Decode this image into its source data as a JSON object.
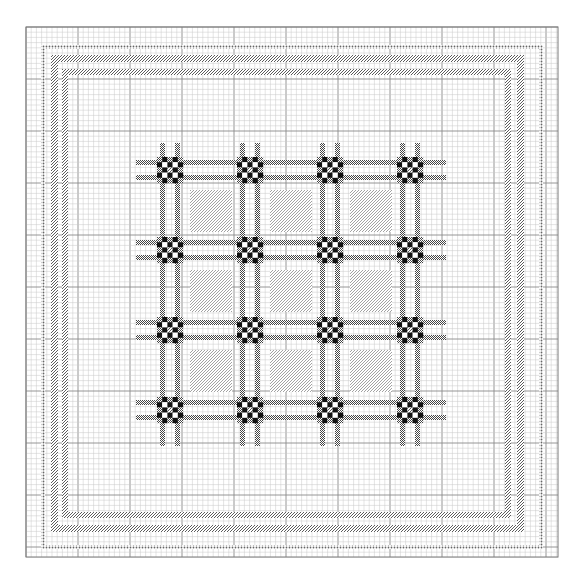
{
  "canvas": {
    "width": 588,
    "height": 588,
    "background": "#ffffff"
  },
  "grid": {
    "left": 26,
    "top": 27,
    "right": 558,
    "bottom": 557,
    "cell": 5.2,
    "fine_line_color": "#c8c8c8",
    "major_line_color": "#8a8a8a",
    "major_every": 10,
    "frame_color": "#7a7a7a"
  },
  "colors": {
    "solid": "#111111",
    "hatch": "#555555",
    "dot": "#666666",
    "white": "#ffffff"
  },
  "borders": [
    {
      "name": "outer-dotted-border",
      "style": "dotted",
      "inset_outer": 41,
      "inset_inner_right": 542,
      "thickness": 4
    },
    {
      "name": "middle-diagonal-border",
      "style": "diagonal",
      "outer": 51,
      "outer_far": 523,
      "thickness": 6
    },
    {
      "name": "inner-diagonal-border",
      "style": "diagonal",
      "outer": 62,
      "outer_far": 510,
      "thickness": 6
    }
  ],
  "lattice": {
    "extent": {
      "left": 136,
      "top": 143,
      "right": 446,
      "bottom": 446
    },
    "crossing_centers": [
      170,
      250,
      330,
      410
    ],
    "stripe_offset": 7.5,
    "stripe_width": 5,
    "crossing_cell": 5.2,
    "crossing_pattern": [
      [
        "s",
        "B",
        "s",
        "B",
        "s"
      ],
      [
        "B",
        "W",
        "B",
        "W",
        "B"
      ],
      [
        "s",
        "B",
        "H",
        "B",
        "s"
      ],
      [
        "B",
        "W",
        "B",
        "W",
        "B"
      ],
      [
        "s",
        "B",
        "s",
        "B",
        "s"
      ]
    ],
    "panels": {
      "count_per_side": 3,
      "inset": 20,
      "style": "diagonal"
    }
  },
  "legend_text": "Pattern: 4×4 crossing motifs, 3×3 hatched panels, triple border"
}
